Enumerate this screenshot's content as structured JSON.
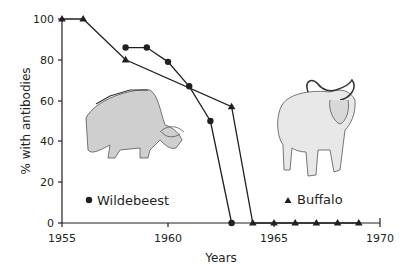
{
  "chart_data": {
    "type": "line",
    "title": "",
    "xlabel": "Years",
    "ylabel": "% with antibodies",
    "xlim": [
      1955,
      1970
    ],
    "ylim": [
      0,
      100
    ],
    "x_ticks": [
      1955,
      1960,
      1965,
      1970
    ],
    "y_ticks": [
      0,
      20,
      40,
      60,
      80,
      100
    ],
    "grid": false,
    "legend_position": "inside, below each animal illustration",
    "series": [
      {
        "name": "Wildebeest",
        "marker": "circle",
        "x": [
          1958,
          1959,
          1960,
          1961,
          1962,
          1963
        ],
        "values": [
          86,
          86,
          79,
          67,
          50,
          0
        ]
      },
      {
        "name": "Buffalo",
        "marker": "triangle",
        "x": [
          1955,
          1956,
          1958,
          1963,
          1964,
          1965,
          1966,
          1967,
          1968,
          1969
        ],
        "values": [
          100,
          100,
          80,
          57,
          0,
          0,
          0,
          0,
          0,
          0
        ]
      }
    ],
    "annotations": [
      "wildebeest illustration",
      "buffalo illustration"
    ]
  },
  "axes": {
    "x_title": "Years",
    "y_title": "% with antibodies",
    "x_tick_labels": [
      "1955",
      "1960",
      "1965",
      "1970"
    ],
    "y_tick_labels": [
      "0",
      "20",
      "40",
      "60",
      "80",
      "100"
    ]
  },
  "legend": {
    "wildebeest_label": "Wildebeest",
    "buffalo_label": "Buffalo"
  },
  "colors": {
    "line": "#231f20",
    "background": "#ffffff"
  }
}
